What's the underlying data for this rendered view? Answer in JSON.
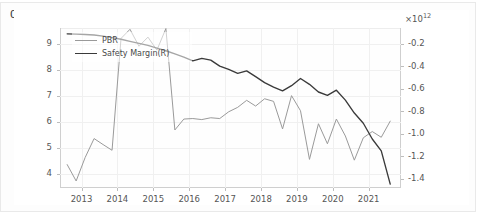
{
  "cell": {
    "out_label": "Out"
  },
  "chart_data": {
    "type": "line",
    "title": "",
    "xlabel": "",
    "ylabel": "",
    "y2label": "",
    "grid": true,
    "legend_position": "upper-left",
    "y2_exponent_label": "×10",
    "y2_exponent_power": "12",
    "xlim": [
      2012.4,
      2021.9
    ],
    "ylim": [
      3.45,
      9.6
    ],
    "y2lim": [
      -1.48,
      -0.06
    ],
    "xticks": [
      "2013",
      "2014",
      "2015",
      "2016",
      "2017",
      "2018",
      "2019",
      "2020",
      "2021"
    ],
    "xtick_values": [
      2013,
      2014,
      2015,
      2016,
      2017,
      2018,
      2019,
      2020,
      2021
    ],
    "yticks_left": [
      "4",
      "5",
      "6",
      "7",
      "8",
      "9"
    ],
    "ytick_left_values": [
      4,
      5,
      6,
      7,
      8,
      9
    ],
    "yticks_right": [
      "-0.2",
      "-0.4",
      "-0.6",
      "-0.8",
      "-1.0",
      "-1.2",
      "-1.4"
    ],
    "ytick_right_values": [
      -0.2,
      -0.4,
      -0.6,
      -0.8,
      -1.0,
      -1.2,
      -1.4
    ],
    "colors": {
      "pbr": "#9a9a9a",
      "safety_margin": "#3a3a3a",
      "grid": "#f0f0f0",
      "spine": "#cfcfcf",
      "text": "#555555"
    },
    "series": [
      {
        "name": "PBR",
        "axis": "left",
        "color": "#9a9a9a",
        "x": [
          2012.6,
          2012.85,
          2013.1,
          2013.35,
          2013.6,
          2013.85,
          2014.1,
          2014.35,
          2014.6,
          2014.85,
          2015.1,
          2015.35,
          2015.6,
          2015.85,
          2016.1,
          2016.35,
          2016.6,
          2016.85,
          2017.1,
          2017.35,
          2017.6,
          2017.85,
          2018.1,
          2018.35,
          2018.6,
          2018.85,
          2019.1,
          2019.35,
          2019.6,
          2019.85,
          2020.1,
          2020.35,
          2020.6,
          2020.85,
          2021.1,
          2021.35,
          2021.6
        ],
        "y": [
          4.35,
          3.72,
          4.62,
          5.35,
          5.12,
          4.9,
          9.2,
          9.55,
          8.9,
          9.25,
          8.75,
          9.58,
          5.68,
          6.1,
          6.12,
          6.08,
          6.15,
          6.12,
          6.38,
          6.55,
          6.82,
          6.6,
          6.88,
          6.78,
          5.72,
          7.0,
          6.42,
          4.55,
          5.92,
          5.15,
          6.1,
          5.45,
          4.52,
          5.38,
          5.62,
          5.4,
          6.02
        ]
      },
      {
        "name": "Safety Margin(R)",
        "axis": "right",
        "color": "#3a3a3a",
        "x": [
          2012.6,
          2012.85,
          2013.1,
          2013.35,
          2013.6,
          2013.85,
          2014.1,
          2014.35,
          2014.6,
          2014.85,
          2015.1,
          2015.35,
          2015.6,
          2015.85,
          2016.1,
          2016.35,
          2016.6,
          2016.85,
          2017.1,
          2017.35,
          2017.6,
          2017.85,
          2018.1,
          2018.35,
          2018.6,
          2018.85,
          2019.1,
          2019.35,
          2019.6,
          2019.85,
          2020.1,
          2020.35,
          2020.6,
          2020.85,
          2021.1,
          2021.35,
          2021.6
        ],
        "y": [
          -0.112,
          -0.115,
          -0.118,
          -0.122,
          -0.132,
          -0.145,
          -0.16,
          -0.178,
          -0.196,
          -0.214,
          -0.238,
          -0.262,
          -0.29,
          -0.318,
          -0.352,
          -0.33,
          -0.345,
          -0.398,
          -0.428,
          -0.462,
          -0.44,
          -0.492,
          -0.545,
          -0.585,
          -0.618,
          -0.572,
          -0.508,
          -0.56,
          -0.628,
          -0.658,
          -0.612,
          -0.7,
          -0.815,
          -0.905,
          -1.045,
          -1.15,
          -1.445
        ]
      }
    ]
  },
  "legend": {
    "items": [
      {
        "label": "PBR",
        "color": "#9a9a9a"
      },
      {
        "label": "Safety Margin(R)",
        "color": "#3a3a3a"
      }
    ]
  }
}
